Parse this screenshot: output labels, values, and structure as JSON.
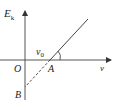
{
  "diagram": {
    "type": "line-graph",
    "axes": {
      "y_label_main": "E",
      "y_label_sub": "k",
      "x_label": "ν",
      "origin_label": "O"
    },
    "points": {
      "A": "A",
      "B": "B"
    },
    "threshold_label_main": "ν",
    "threshold_label_sub": "0",
    "colors": {
      "line": "#444444",
      "text": "#222222",
      "background": "#ffffff"
    }
  }
}
